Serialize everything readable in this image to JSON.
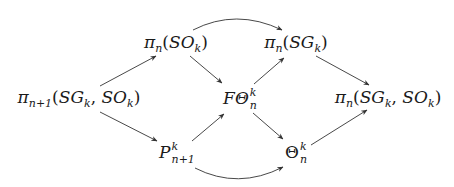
{
  "nodes": {
    "source": {
      "fn": "π",
      "sub": "n+1",
      "args": [
        "SG",
        "k",
        "SO",
        "k"
      ],
      "label": "π_{n+1}(SG_k, SO_k)"
    },
    "pi_so": {
      "fn": "π",
      "sub": "n",
      "args": [
        "SO",
        "k"
      ],
      "label": "π_n(SO_k)"
    },
    "pi_sg": {
      "fn": "π",
      "sub": "n",
      "args": [
        "SG",
        "k"
      ],
      "label": "π_n(SG_k)"
    },
    "f_theta": {
      "base": "FΘ",
      "sup": "k",
      "sub": "n",
      "label": "FΘ^k_n"
    },
    "target": {
      "fn": "π",
      "sub": "n",
      "args": [
        "SG",
        "k",
        "SO",
        "k"
      ],
      "label": "π_n(SG_k, SO_k)"
    },
    "p": {
      "base": "P",
      "sup": "k",
      "sub": "n+1",
      "label": "P^k_{n+1}"
    },
    "theta": {
      "base": "Θ",
      "sup": "k",
      "sub": "n",
      "label": "Θ^k_n"
    }
  },
  "edges": [
    {
      "from": "source",
      "to": "pi_so",
      "style": "straight"
    },
    {
      "from": "source",
      "to": "p",
      "style": "straight"
    },
    {
      "from": "pi_so",
      "to": "f_theta",
      "style": "straight"
    },
    {
      "from": "pi_so",
      "to": "pi_sg",
      "style": "curved-up"
    },
    {
      "from": "p",
      "to": "f_theta",
      "style": "straight"
    },
    {
      "from": "p",
      "to": "theta",
      "style": "curved-down"
    },
    {
      "from": "f_theta",
      "to": "pi_sg",
      "style": "straight"
    },
    {
      "from": "f_theta",
      "to": "theta",
      "style": "straight"
    },
    {
      "from": "pi_sg",
      "to": "target",
      "style": "straight"
    },
    {
      "from": "theta",
      "to": "target",
      "style": "straight"
    }
  ]
}
